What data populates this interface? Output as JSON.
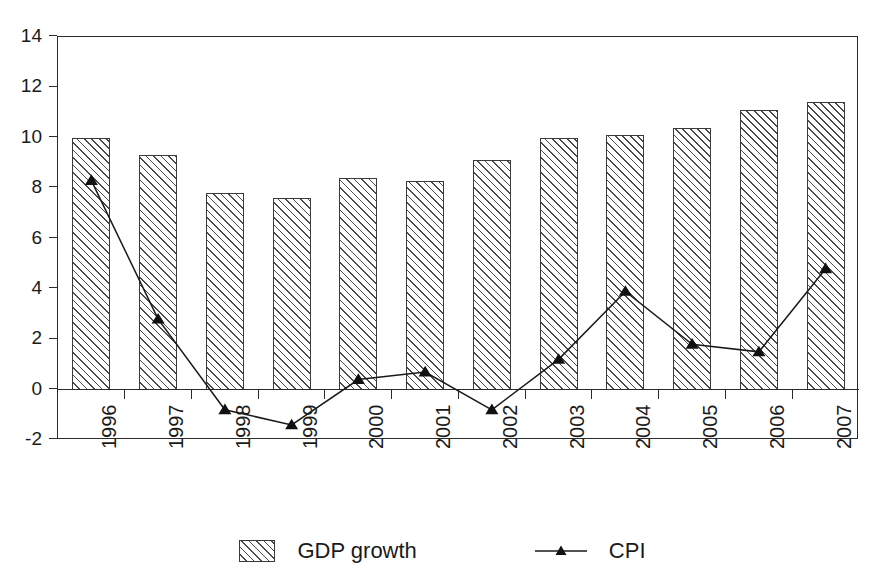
{
  "figure": {
    "background_color": "#ffffff",
    "axis_color": "#2b2b2b",
    "series_color": "#1a1a1a",
    "hatch_color": "#4a4a4a"
  },
  "legend": {
    "position": "bottom-center",
    "entries": [
      {
        "label": "GDP growth",
        "marker": "hatched-swatch"
      },
      {
        "label": "CPI",
        "marker": "line-triangle"
      }
    ]
  },
  "chart_data": {
    "type": "bar",
    "title": "",
    "subtitle": "",
    "xlabel": "",
    "ylabel": "",
    "grid": false,
    "legend_position": "bottom-center",
    "ylim": [
      -2,
      14
    ],
    "yticks": [
      -2,
      0,
      2,
      4,
      6,
      8,
      10,
      12,
      14
    ],
    "ytick_labels": [
      "-2",
      "0",
      "2",
      "4",
      "6",
      "8",
      "10",
      "12",
      "14"
    ],
    "categories": [
      "1996",
      "1997",
      "1998",
      "1999",
      "2000",
      "2001",
      "2002",
      "2003",
      "2004",
      "2005",
      "2006",
      "2007"
    ],
    "series": [
      {
        "name": "GDP growth",
        "type": "bar",
        "values": [
          10.0,
          9.3,
          7.8,
          7.6,
          8.4,
          8.3,
          9.1,
          10.0,
          10.1,
          10.4,
          11.1,
          11.4
        ]
      },
      {
        "name": "CPI",
        "type": "line",
        "marker": "triangle",
        "values": [
          8.3,
          2.8,
          -0.8,
          -1.4,
          0.4,
          0.7,
          -0.8,
          1.2,
          3.9,
          1.8,
          1.5,
          4.8
        ]
      }
    ]
  }
}
